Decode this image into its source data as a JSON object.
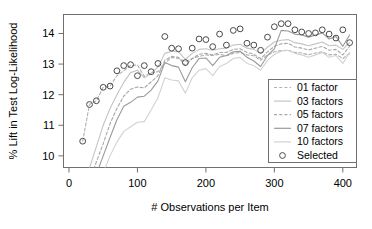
{
  "chart_data": {
    "type": "line",
    "title": "",
    "xlabel": "# Observations per Item",
    "ylabel": "% Lift in Test Log-Likelihood",
    "xlim": [
      -8,
      420
    ],
    "ylim": [
      9.62,
      14.62
    ],
    "xticks": [
      0,
      100,
      200,
      300,
      400
    ],
    "xtick_labels": [
      "0",
      "100",
      "200",
      "300",
      "400"
    ],
    "yticks": [
      10,
      11,
      12,
      13,
      14
    ],
    "ytick_labels": [
      "10",
      "11",
      "12",
      "13",
      "14"
    ],
    "grid": false,
    "legend_position": "bottom-right",
    "x": [
      20,
      30,
      40,
      50,
      60,
      70,
      80,
      90,
      100,
      110,
      120,
      130,
      140,
      150,
      160,
      170,
      180,
      190,
      200,
      210,
      220,
      230,
      240,
      250,
      260,
      270,
      280,
      290,
      300,
      310,
      320,
      330,
      340,
      350,
      360,
      370,
      380,
      390,
      400,
      410
    ],
    "series": [
      {
        "name": "01 factor",
        "linestyle": "dashed",
        "color": "#b0b0b0",
        "values": [
          10.48,
          11.68,
          11.8,
          12.24,
          12.28,
          12.62,
          12.78,
          12.95,
          12.97,
          12.6,
          12.72,
          12.75,
          13.02,
          13.22,
          13.18,
          13.08,
          13.18,
          13.25,
          13.3,
          13.28,
          13.32,
          13.27,
          13.35,
          13.38,
          13.3,
          13.27,
          13.12,
          13.3,
          13.4,
          13.44,
          13.45,
          13.38,
          13.36,
          13.3,
          13.36,
          13.4,
          13.3,
          13.32,
          13.18,
          13.35
        ]
      },
      {
        "name": "03 factors",
        "linestyle": "solid",
        "color": "#c4c4c4",
        "values": [
          9.2,
          9.6,
          10.3,
          11.0,
          11.55,
          12.0,
          12.4,
          12.72,
          12.8,
          12.55,
          12.7,
          12.9,
          13.35,
          13.42,
          13.4,
          13.15,
          13.35,
          13.48,
          13.5,
          13.45,
          13.5,
          13.52,
          13.62,
          13.65,
          13.52,
          13.48,
          13.35,
          13.55,
          13.72,
          13.78,
          13.8,
          13.7,
          13.66,
          13.6,
          13.66,
          13.72,
          13.6,
          13.62,
          13.48,
          13.7
        ]
      },
      {
        "name": "05 factors",
        "linestyle": "dashed",
        "color": "#a8a8a8",
        "values": [
          8.8,
          9.2,
          9.8,
          10.4,
          11.05,
          11.55,
          11.95,
          12.18,
          12.25,
          12.22,
          12.42,
          12.62,
          13.12,
          13.25,
          13.22,
          12.95,
          13.18,
          13.32,
          13.35,
          13.3,
          13.38,
          13.38,
          13.48,
          13.5,
          13.38,
          13.32,
          13.18,
          13.4,
          13.58,
          13.66,
          13.68,
          13.56,
          13.52,
          13.46,
          13.52,
          13.58,
          13.45,
          13.48,
          13.3,
          13.58
        ]
      },
      {
        "name": "07 factors",
        "linestyle": "solid",
        "color": "#9a9a9a",
        "values": [
          8.4,
          8.85,
          9.4,
          10.0,
          10.6,
          11.18,
          11.62,
          11.75,
          11.92,
          11.95,
          12.15,
          12.45,
          13.05,
          12.95,
          12.9,
          12.42,
          12.88,
          13.18,
          13.2,
          12.95,
          13.22,
          13.28,
          13.4,
          13.42,
          13.22,
          13.1,
          12.92,
          13.28,
          13.5,
          14.1,
          14.08,
          13.98,
          13.95,
          13.88,
          13.95,
          14.02,
          13.82,
          13.9,
          13.58,
          13.95
        ]
      },
      {
        "name": "10 factors",
        "linestyle": "solid",
        "color": "#d2d2d2",
        "values": [
          8.0,
          8.4,
          8.9,
          9.45,
          10.0,
          10.45,
          10.8,
          10.95,
          11.1,
          11.12,
          11.5,
          11.9,
          12.55,
          12.48,
          12.45,
          12.05,
          12.55,
          12.8,
          12.85,
          12.62,
          12.92,
          13.02,
          13.18,
          13.22,
          13.02,
          12.95,
          12.8,
          13.12,
          13.32,
          13.42,
          13.45,
          13.35,
          13.3,
          13.22,
          13.3,
          13.38,
          13.22,
          13.28,
          13.02,
          13.38
        ]
      }
    ],
    "selected": {
      "name": "Selected",
      "marker": "circle-open",
      "color": "#4a4a4a",
      "x": [
        20,
        30,
        40,
        50,
        60,
        70,
        80,
        90,
        100,
        110,
        120,
        130,
        140,
        150,
        160,
        170,
        180,
        190,
        200,
        210,
        220,
        230,
        240,
        250,
        260,
        270,
        280,
        290,
        300,
        310,
        320,
        330,
        340,
        350,
        360,
        370,
        380,
        390,
        400,
        410
      ],
      "values": [
        10.48,
        11.68,
        11.8,
        12.24,
        12.28,
        12.78,
        12.95,
        12.98,
        12.62,
        12.95,
        12.75,
        13.02,
        13.9,
        13.52,
        13.5,
        13.05,
        13.52,
        13.82,
        13.8,
        13.57,
        13.98,
        13.62,
        14.1,
        14.15,
        13.68,
        13.62,
        13.45,
        13.88,
        14.22,
        14.32,
        14.32,
        14.12,
        14.05,
        14.0,
        14.02,
        14.12,
        13.98,
        13.85,
        14.12,
        13.7
      ]
    },
    "legend_entries": [
      {
        "label": "01 factor",
        "style": "dashed",
        "color": "#b0b0b0"
      },
      {
        "label": "03 factors",
        "style": "solid",
        "color": "#c4c4c4"
      },
      {
        "label": "05 factors",
        "style": "dashed",
        "color": "#a8a8a8"
      },
      {
        "label": "07 factors",
        "style": "solid",
        "color": "#9a9a9a"
      },
      {
        "label": "10 factors",
        "style": "solid",
        "color": "#d2d2d2"
      },
      {
        "label": "Selected",
        "style": "marker",
        "color": "#4a4a4a"
      }
    ]
  },
  "axes": {
    "x_title": "# Observations per Item",
    "y_title": "% Lift in Test Log-Likelihood",
    "xtick_0": "0",
    "xtick_1": "100",
    "xtick_2": "200",
    "xtick_3": "300",
    "xtick_4": "400",
    "ytick_0": "10",
    "ytick_1": "11",
    "ytick_2": "12",
    "ytick_3": "13",
    "ytick_4": "14"
  },
  "legend": {
    "item_0": "01 factor",
    "item_1": "03 factors",
    "item_2": "05 factors",
    "item_3": "07 factors",
    "item_4": "10 factors",
    "item_5": "Selected"
  }
}
